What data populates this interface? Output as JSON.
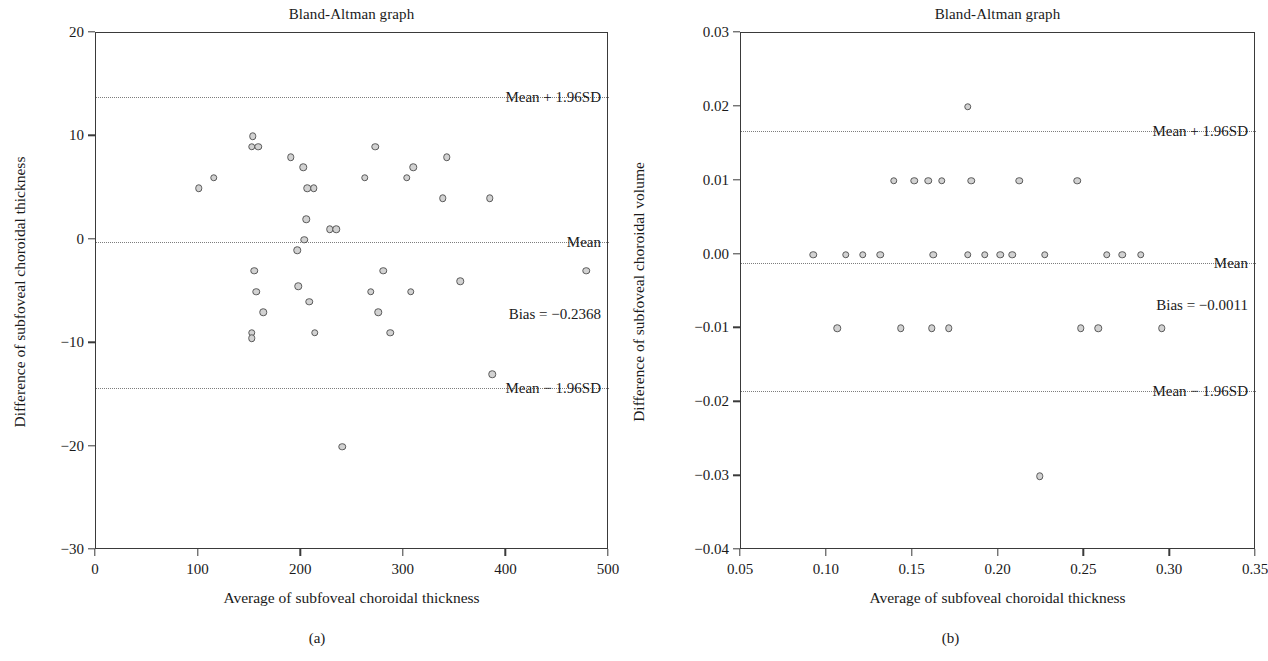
{
  "figure": {
    "background": "#ffffff",
    "marker_fill": "#d2d2d2",
    "marker_stroke": "#5a5a5a",
    "axis_color": "#3a3a3a",
    "refline_color": "#7d7d7d"
  },
  "panels": [
    {
      "id": "a",
      "caption": "(a)",
      "title": "Bland-Altman graph",
      "xlabel": "Average of subfoveal choroidal thickness",
      "ylabel": "Difference of subfoveal choroidal thickness",
      "bias_label": "Bias = −0.2368",
      "upper_label": "Mean + 1.96SD",
      "mean_label": "Mean",
      "lower_label": "Mean − 1.96SD",
      "xticks": [
        "0",
        "100",
        "200",
        "300",
        "400",
        "500"
      ],
      "xtick_values": [
        0,
        100,
        200,
        300,
        400,
        500
      ],
      "yticks": [
        "20",
        "10",
        "0",
        "−10",
        "−20",
        "−30"
      ],
      "ytick_values": [
        20,
        10,
        0,
        -10,
        -20,
        -30
      ]
    },
    {
      "id": "b",
      "caption": "(b)",
      "title": "Bland-Altman graph",
      "xlabel": "Average of subfoveal choroidal thickness",
      "ylabel": "Difference of subfoveal choroidal volume",
      "bias_label": "Bias = −0.0011",
      "upper_label": "Mean + 1.96SD",
      "mean_label": "Mean",
      "lower_label": "Mean − 1.96SD",
      "xticks": [
        "0.05",
        "0.10",
        "0.15",
        "0.20",
        "0.25",
        "0.30",
        "0.35"
      ],
      "xtick_values": [
        0.05,
        0.1,
        0.15,
        0.2,
        0.25,
        0.3,
        0.35
      ],
      "yticks": [
        "0.03",
        "0.02",
        "0.01",
        "0.00",
        "−0.01",
        "−0.02",
        "−0.03",
        "−0.04"
      ],
      "ytick_values": [
        0.03,
        0.02,
        0.01,
        0.0,
        -0.01,
        -0.02,
        -0.03,
        -0.04
      ]
    }
  ],
  "chart_data": [
    {
      "type": "scatter",
      "panel": "a",
      "title": "Bland-Altman graph",
      "xlabel": "Average of subfoveal choroidal thickness",
      "ylabel": "Difference of subfoveal choroidal thickness",
      "xlim": [
        0,
        500
      ],
      "ylim": [
        -30,
        20
      ],
      "grid": false,
      "legend": null,
      "annotations": [
        {
          "text": "Mean + 1.96SD",
          "y": 13.8,
          "align": "right"
        },
        {
          "text": "Mean",
          "y": -0.24,
          "align": "right"
        },
        {
          "text": "Bias = −0.2368",
          "y": -7.2,
          "align": "right"
        },
        {
          "text": "Mean − 1.96SD",
          "y": -14.3,
          "align": "right"
        }
      ],
      "reference_lines": [
        {
          "name": "upper_loa",
          "value": 13.8,
          "style": "dotted"
        },
        {
          "name": "mean_bias",
          "value": -0.2368,
          "style": "dotted"
        },
        {
          "name": "lower_loa",
          "value": -14.3,
          "style": "dotted"
        }
      ],
      "points": [
        {
          "x": 100,
          "y": 5
        },
        {
          "x": 115,
          "y": 6
        },
        {
          "x": 153,
          "y": 10
        },
        {
          "x": 152,
          "y": 9
        },
        {
          "x": 158,
          "y": 9
        },
        {
          "x": 154,
          "y": -3
        },
        {
          "x": 156,
          "y": -5
        },
        {
          "x": 152,
          "y": -9
        },
        {
          "x": 152,
          "y": -9.5
        },
        {
          "x": 163,
          "y": -7
        },
        {
          "x": 190,
          "y": 8
        },
        {
          "x": 196,
          "y": -1
        },
        {
          "x": 197,
          "y": -4.5
        },
        {
          "x": 202,
          "y": 7
        },
        {
          "x": 206,
          "y": 5
        },
        {
          "x": 212,
          "y": 5
        },
        {
          "x": 205,
          "y": 2
        },
        {
          "x": 203,
          "y": 0
        },
        {
          "x": 208,
          "y": -6
        },
        {
          "x": 213,
          "y": -9
        },
        {
          "x": 228,
          "y": 1
        },
        {
          "x": 234,
          "y": 1
        },
        {
          "x": 240,
          "y": -20
        },
        {
          "x": 262,
          "y": 6
        },
        {
          "x": 272,
          "y": 9
        },
        {
          "x": 268,
          "y": -5
        },
        {
          "x": 275,
          "y": -7
        },
        {
          "x": 280,
          "y": -3
        },
        {
          "x": 287,
          "y": -9
        },
        {
          "x": 303,
          "y": 6
        },
        {
          "x": 309,
          "y": 7
        },
        {
          "x": 307,
          "y": -5
        },
        {
          "x": 342,
          "y": 8
        },
        {
          "x": 338,
          "y": 4
        },
        {
          "x": 355,
          "y": -4
        },
        {
          "x": 384,
          "y": 4
        },
        {
          "x": 386,
          "y": -13
        },
        {
          "x": 478,
          "y": -3
        }
      ]
    },
    {
      "type": "scatter",
      "panel": "b",
      "title": "Bland-Altman graph",
      "xlabel": "Average of subfoveal choroidal thickness",
      "ylabel": "Difference of subfoveal choroidal volume",
      "xlim": [
        0.05,
        0.35
      ],
      "ylim": [
        -0.04,
        0.03
      ],
      "grid": false,
      "legend": null,
      "annotations": [
        {
          "text": "Mean + 1.96SD",
          "y": 0.0167,
          "align": "right"
        },
        {
          "text": "Mean",
          "y": -0.0011,
          "align": "right"
        },
        {
          "text": "Bias = −0.0011",
          "y": -0.0068,
          "align": "right"
        },
        {
          "text": "Mean − 1.96SD",
          "y": -0.0185,
          "align": "right"
        }
      ],
      "reference_lines": [
        {
          "name": "upper_loa",
          "value": 0.0167,
          "style": "dotted"
        },
        {
          "name": "mean_bias",
          "value": -0.0011,
          "style": "dotted"
        },
        {
          "name": "lower_loa",
          "value": -0.0185,
          "style": "dotted"
        }
      ],
      "points": [
        {
          "x": 0.182,
          "y": 0.02
        },
        {
          "x": 0.139,
          "y": 0.01
        },
        {
          "x": 0.151,
          "y": 0.01
        },
        {
          "x": 0.159,
          "y": 0.01
        },
        {
          "x": 0.167,
          "y": 0.01
        },
        {
          "x": 0.184,
          "y": 0.01
        },
        {
          "x": 0.212,
          "y": 0.01
        },
        {
          "x": 0.246,
          "y": 0.01
        },
        {
          "x": 0.092,
          "y": 0.0
        },
        {
          "x": 0.111,
          "y": 0.0
        },
        {
          "x": 0.121,
          "y": 0.0
        },
        {
          "x": 0.131,
          "y": 0.0
        },
        {
          "x": 0.162,
          "y": 0.0
        },
        {
          "x": 0.182,
          "y": 0.0
        },
        {
          "x": 0.192,
          "y": 0.0
        },
        {
          "x": 0.201,
          "y": 0.0
        },
        {
          "x": 0.208,
          "y": 0.0
        },
        {
          "x": 0.227,
          "y": 0.0
        },
        {
          "x": 0.263,
          "y": 0.0
        },
        {
          "x": 0.272,
          "y": 0.0
        },
        {
          "x": 0.283,
          "y": 0.0
        },
        {
          "x": 0.106,
          "y": -0.01
        },
        {
          "x": 0.143,
          "y": -0.01
        },
        {
          "x": 0.161,
          "y": -0.01
        },
        {
          "x": 0.171,
          "y": -0.01
        },
        {
          "x": 0.248,
          "y": -0.01
        },
        {
          "x": 0.258,
          "y": -0.01
        },
        {
          "x": 0.295,
          "y": -0.01
        },
        {
          "x": 0.224,
          "y": -0.03
        }
      ]
    }
  ]
}
